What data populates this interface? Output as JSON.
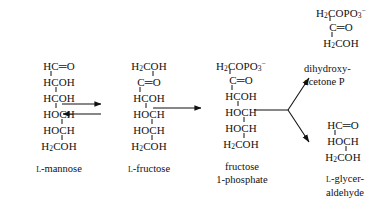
{
  "diagram": {
    "ink_color": "#111111",
    "background_color": "#ffffff"
  },
  "structures": {
    "mannose": {
      "name": "L-mannose",
      "caption_prefix": "L",
      "caption_rest": "-mannose",
      "rows": [
        "HC═O",
        "HCOH",
        "HCOH",
        "HOCH",
        "HOCH",
        "H₂COH"
      ],
      "r1": "HC",
      "r1b": "═O",
      "r2": "HCOH",
      "r3": "HCOH",
      "r4": "HOCH",
      "r5": "HOCH",
      "r6a": "H",
      "r6sub": "2",
      "r6b": "COH"
    },
    "fructose": {
      "name": "L-fructose",
      "caption_prefix": "L",
      "caption_rest": "-fructose",
      "r1a": "H",
      "r1sub": "2",
      "r1b": "COH",
      "r2": "C",
      "r2b": "═O",
      "r3": "HCOH",
      "r4": "HOCH",
      "r5": "HOCH",
      "r6a": "H",
      "r6sub": "2",
      "r6b": "COH"
    },
    "fructose_1_phosphate": {
      "name": "fructose 1-phosphate",
      "caption_line1": "fructose",
      "caption_line2": "1-phosphate",
      "r1a": "H",
      "r1sub": "2",
      "r1b": "COPO",
      "r1sub2": "3",
      "r1sup": "−",
      "r2": "C",
      "r2b": "═O",
      "r3": "HCOH",
      "r4": "HOCH",
      "r5": "HOCH",
      "r6a": "H",
      "r6sub": "2",
      "r6b": "COH"
    },
    "dihydroxyacetone_phosphate": {
      "name": "dihydroxyacetone P",
      "caption_line1": "dihydroxy-",
      "caption_line2": "acetone  P",
      "r1a": "H",
      "r1sub": "2",
      "r1b": "COPO",
      "r1sub2": "3",
      "r1sup": "−",
      "r2": "C",
      "r2b": "═O",
      "r3a": "H",
      "r3sub": "2",
      "r3b": "COH"
    },
    "glyceraldehyde": {
      "name": "L-glyceraldehyde",
      "caption_prefix": "L",
      "caption_line1_rest": "-glycer-",
      "caption_line2": "aldehyde",
      "r1": "HC",
      "r1b": "═O",
      "r2": "HOCH",
      "r3a": "H",
      "r3sub": "2",
      "r3b": "COH"
    }
  },
  "arrows": {
    "mannose_to_fructose": {
      "type": "equilibrium",
      "label": "reversible isomerization arrows"
    },
    "fructose_to_f1p": {
      "type": "single-right",
      "label": "phosphorylation arrow"
    },
    "f1p_split_upper": {
      "type": "branch-up-right",
      "label": "aldolase cleavage to dihydroxyacetone P"
    },
    "f1p_split_lower": {
      "type": "branch-down-right",
      "label": "aldolase cleavage to L-glyceraldehyde"
    }
  }
}
